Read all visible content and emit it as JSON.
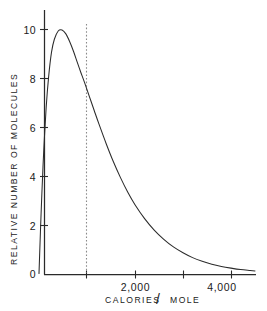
{
  "chart_data": {
    "type": "line",
    "title": "",
    "xlabel": "CALORIES / MOLE",
    "ylabel": "RELATIVE NUMBER OF MOLECULES",
    "xlim": [
      0,
      4500
    ],
    "ylim": [
      0,
      10.6
    ],
    "grid": false,
    "legend": null,
    "x_tick_values": [
      2000,
      4000
    ],
    "x_tick_labels": [
      "2,000",
      "4,000"
    ],
    "x_minor_tick_values": [
      870,
      3000
    ],
    "y_tick_values": [
      0,
      2,
      4,
      6,
      8,
      10
    ],
    "y_tick_labels": [
      "0",
      "2",
      "4",
      "6",
      "8",
      "10"
    ],
    "annotations": [
      {
        "name": "activation-energy-line",
        "type": "vertical-dashed-line",
        "x": 870,
        "style": "dotted",
        "color": "#8a8a8a"
      }
    ],
    "series": [
      {
        "name": "Maxwell-Boltzmann energy distribution",
        "color": "#2b2b2b",
        "x": [
          0,
          30,
          60,
          100,
          150,
          200,
          260,
          320,
          400,
          480,
          560,
          640,
          720,
          800,
          870,
          950,
          1050,
          1150,
          1250,
          1400,
          1550,
          1700,
          1850,
          2000,
          2200,
          2400,
          2600,
          2800,
          3000,
          3200,
          3400,
          3600,
          3800,
          4000,
          4200,
          4400,
          4500
        ],
        "y": [
          0,
          1.72,
          3.29,
          5.08,
          6.82,
          8.05,
          9.06,
          9.6,
          9.94,
          9.98,
          9.82,
          9.5,
          9.1,
          8.64,
          8.25,
          7.82,
          7.25,
          6.68,
          6.12,
          5.32,
          4.58,
          3.92,
          3.33,
          2.82,
          2.25,
          1.78,
          1.4,
          1.09,
          0.85,
          0.65,
          0.5,
          0.38,
          0.29,
          0.22,
          0.16,
          0.12,
          0.1
        ]
      }
    ]
  },
  "axes": {
    "y_title": "RELATIVE NUMBER OF MOLECULES",
    "x_title_parts": {
      "left": "CALORIES",
      "slash": "/",
      "right": "MOLE"
    }
  }
}
